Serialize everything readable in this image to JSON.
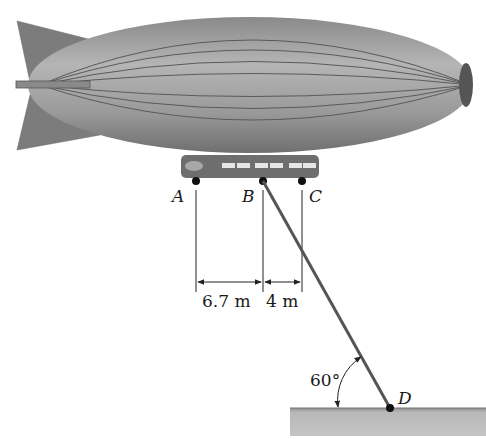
{
  "figure": {
    "points": {
      "A": "A",
      "B": "B",
      "C": "C",
      "D": "D"
    },
    "dimensions": {
      "AB": "6.7 m",
      "BC": "4 m"
    },
    "angle": "60°",
    "colors": {
      "envelope": "#8c8c8c",
      "fins": "#7a7a7a",
      "gondola": "#6e6e6e",
      "ground": "#b0b0b0",
      "lines": "#222222"
    }
  }
}
